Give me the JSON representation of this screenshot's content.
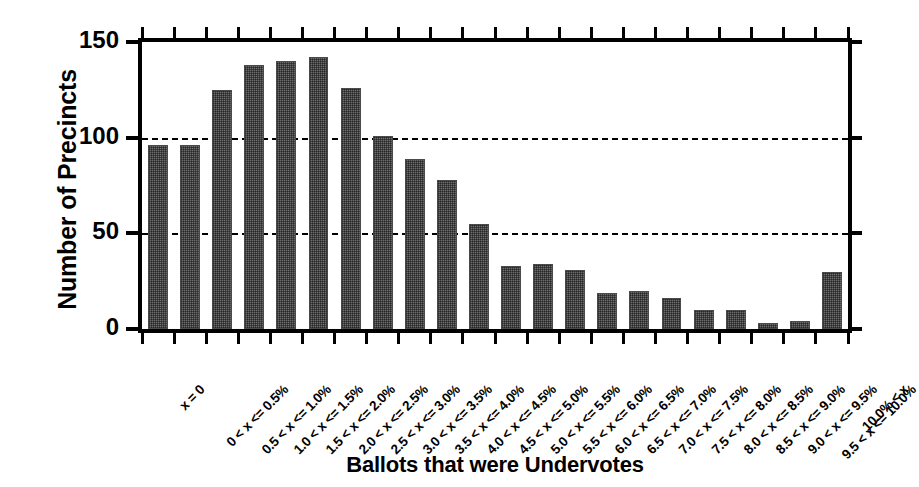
{
  "chart_data": {
    "type": "bar",
    "title": "",
    "xlabel": "Ballots that were Undervotes",
    "ylabel": "Number of Precincts",
    "ylim": [
      0,
      150
    ],
    "yticks": [
      0,
      50,
      100,
      150
    ],
    "ytick_labels": [
      "0",
      "50",
      "100",
      "150"
    ],
    "grid": "horizontal dashed gridlines at 50 and 100",
    "legend": "none",
    "categories": [
      "x = 0",
      "0 < x <= 0.5%",
      "0.5 < x <= 1.0%",
      "1.0 < x <= 1.5%",
      "1.5 < x <= 2.0%",
      "2.0 < x <= 2.5%",
      "2.5 < x <= 3.0%",
      "3.0 < x <= 3.5%",
      "3.5 < x <= 4.0%",
      "4.0 < x <= 4.5%",
      "4.5 < x <= 5.0%",
      "5.0 < x <= 5.5%",
      "5.5 < x <= 6.0%",
      "6.0 < x <= 6.5%",
      "6.5 < x <= 7.0%",
      "7.0 < x <= 7.5%",
      "7.5 < x <= 8.0%",
      "8.0 < x <= 8.5%",
      "8.5 < x <= 9.0%",
      "9.0 < x <= 9.5%",
      "9.5 < x <= 10.0%",
      "10.0% < x"
    ],
    "values": [
      96,
      96,
      125,
      138,
      140,
      142,
      126,
      101,
      89,
      78,
      55,
      33,
      34,
      31,
      19,
      20,
      16,
      10,
      10,
      3,
      4,
      30
    ],
    "bar_color": "#6e6e6e"
  }
}
